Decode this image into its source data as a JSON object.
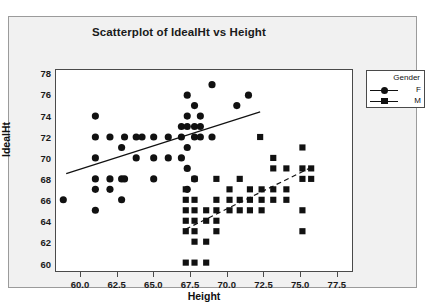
{
  "top_cut_text": "",
  "chart": {
    "title": "Scatterplot of IdealHt vs Height",
    "xlabel": "Height",
    "ylabel": "IdealHt"
  },
  "legend": {
    "title": "Gender",
    "entries": [
      {
        "label": "F",
        "marker": "circle-marker",
        "line": "solid"
      },
      {
        "label": "M",
        "marker": "square-marker",
        "line": "dashed"
      }
    ]
  },
  "chart_data": {
    "type": "scatter",
    "title": "Scatterplot of IdealHt vs Height",
    "xlabel": "Height",
    "ylabel": "IdealHt",
    "xlim": [
      58.3,
      78.6
    ],
    "ylim": [
      59.2,
      78.4
    ],
    "xticks": [
      "60.0",
      "62.5",
      "65.0",
      "67.5",
      "70.0",
      "72.5",
      "75.0",
      "77.5"
    ],
    "xtick_values": [
      60.0,
      62.5,
      65.0,
      67.5,
      70.0,
      72.5,
      75.0,
      77.5
    ],
    "yticks": [
      "60",
      "62",
      "64",
      "66",
      "68",
      "70",
      "72",
      "74",
      "76",
      "78"
    ],
    "ytick_values": [
      60,
      62,
      64,
      66,
      68,
      70,
      72,
      74,
      76,
      78
    ],
    "grid": false,
    "legend_position": "outside-right-top",
    "legend_title": "Gender",
    "series": [
      {
        "name": "F",
        "marker": "circle",
        "color": "#111111",
        "fit_line": {
          "style": "solid",
          "x_start": 59.0,
          "y_start": 68.5,
          "x_end": 72.3,
          "y_end": 74.4
        },
        "points": [
          [
            58.8,
            66.0
          ],
          [
            61.0,
            72.0
          ],
          [
            61.0,
            70.0
          ],
          [
            61.0,
            74.0
          ],
          [
            61.0,
            68.0
          ],
          [
            61.0,
            67.0
          ],
          [
            61.0,
            65.0
          ],
          [
            62.0,
            72.0
          ],
          [
            62.0,
            68.0
          ],
          [
            62.0,
            67.0
          ],
          [
            62.8,
            71.0
          ],
          [
            62.8,
            68.0
          ],
          [
            62.8,
            66.0
          ],
          [
            63.0,
            72.0
          ],
          [
            63.0,
            68.0
          ],
          [
            63.8,
            72.0
          ],
          [
            63.8,
            70.0
          ],
          [
            64.2,
            72.0
          ],
          [
            65.0,
            72.0
          ],
          [
            65.0,
            70.0
          ],
          [
            65.0,
            68.0
          ],
          [
            66.0,
            72.0
          ],
          [
            66.0,
            70.0
          ],
          [
            66.9,
            73.0
          ],
          [
            66.9,
            72.0
          ],
          [
            66.9,
            70.0
          ],
          [
            67.3,
            76.0
          ],
          [
            67.3,
            74.0
          ],
          [
            67.3,
            73.0
          ],
          [
            67.3,
            71.0
          ],
          [
            67.3,
            69.0
          ],
          [
            67.3,
            67.0
          ],
          [
            67.8,
            75.0
          ],
          [
            67.8,
            73.0
          ],
          [
            67.8,
            72.0
          ],
          [
            67.8,
            68.0
          ],
          [
            68.2,
            74.0
          ],
          [
            68.2,
            73.0
          ],
          [
            68.2,
            72.0
          ],
          [
            69.0,
            77.0
          ],
          [
            69.0,
            72.0
          ],
          [
            70.7,
            75.0
          ],
          [
            71.5,
            76.0
          ]
        ]
      },
      {
        "name": "M",
        "marker": "square",
        "color": "#111111",
        "fit_line": {
          "style": "dashed",
          "x_start": 67.2,
          "y_start": 63.2,
          "x_end": 75.8,
          "y_end": 69.1
        },
        "points": [
          [
            67.2,
            67.0
          ],
          [
            67.2,
            66.0
          ],
          [
            67.2,
            65.0
          ],
          [
            67.2,
            64.0
          ],
          [
            67.2,
            63.0
          ],
          [
            67.2,
            60.0
          ],
          [
            67.8,
            68.0
          ],
          [
            67.8,
            66.0
          ],
          [
            67.8,
            65.0
          ],
          [
            67.8,
            64.0
          ],
          [
            67.8,
            63.0
          ],
          [
            67.8,
            62.0
          ],
          [
            67.8,
            60.0
          ],
          [
            68.6,
            65.0
          ],
          [
            68.6,
            64.0
          ],
          [
            68.6,
            62.0
          ],
          [
            68.6,
            60.0
          ],
          [
            69.3,
            68.0
          ],
          [
            69.3,
            66.0
          ],
          [
            69.3,
            65.0
          ],
          [
            69.3,
            64.0
          ],
          [
            69.3,
            63.0
          ],
          [
            70.2,
            67.0
          ],
          [
            70.2,
            66.0
          ],
          [
            70.2,
            65.0
          ],
          [
            70.9,
            68.0
          ],
          [
            70.9,
            66.0
          ],
          [
            70.9,
            65.0
          ],
          [
            71.6,
            67.0
          ],
          [
            71.6,
            66.0
          ],
          [
            71.6,
            65.0
          ],
          [
            72.3,
            72.0
          ],
          [
            72.4,
            67.0
          ],
          [
            72.4,
            66.0
          ],
          [
            72.4,
            65.0
          ],
          [
            73.2,
            70.0
          ],
          [
            73.2,
            69.0
          ],
          [
            73.2,
            67.0
          ],
          [
            73.2,
            66.0
          ],
          [
            74.1,
            69.0
          ],
          [
            74.1,
            67.0
          ],
          [
            74.1,
            66.0
          ],
          [
            75.2,
            71.0
          ],
          [
            75.2,
            69.0
          ],
          [
            75.2,
            68.0
          ],
          [
            75.2,
            65.0
          ],
          [
            75.2,
            63.0
          ],
          [
            75.8,
            69.0
          ],
          [
            75.8,
            68.0
          ]
        ]
      }
    ]
  }
}
